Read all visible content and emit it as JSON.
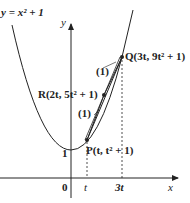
{
  "diagram": {
    "curve_label": "y = x² + 1",
    "axes": {
      "x_label": "x",
      "y_label": "y",
      "origin_label": "0",
      "y_intercept_label": "1"
    },
    "x_ticks": [
      "t",
      "3t"
    ],
    "points": [
      {
        "name": "P",
        "label": "P(t,  t² + 1)"
      },
      {
        "name": "R",
        "label": "R(2t,  5t² + 1)"
      },
      {
        "name": "Q",
        "label": "Q(3t,  9t² + 1)"
      }
    ],
    "segment_labels": [
      "(1)",
      "(1)"
    ],
    "colors": {
      "ink": "#222222",
      "background": "#ffffff"
    }
  }
}
